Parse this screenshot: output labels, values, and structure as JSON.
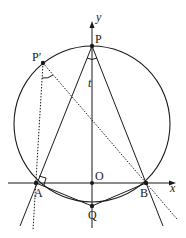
{
  "diagram": {
    "type": "geometry",
    "colors": {
      "stroke": "#1a1a1a",
      "background": "#ffffff"
    },
    "axes": {
      "x_label": "x",
      "y_label": "y",
      "origin_label": "O"
    },
    "circle": {
      "cx": 92,
      "cy": 124,
      "r": 78
    },
    "points": {
      "P": {
        "label": "P",
        "x": 92,
        "y": 46
      },
      "P_prime": {
        "label": "P′",
        "x": 43,
        "y": 63
      },
      "A": {
        "label": "A",
        "x": 36,
        "y": 183
      },
      "B": {
        "label": "B",
        "x": 146,
        "y": 183
      },
      "O": {
        "label": "O",
        "x": 92,
        "y": 183
      },
      "Q": {
        "label": "Q",
        "x": 92,
        "y": 206
      }
    },
    "segment_label": {
      "label": "t",
      "x": 89,
      "y": 86
    },
    "annotations": [
      "angle arc at P between PA and PB",
      "angle arc at P′ between P′A and P′B",
      "right angle mark at A between x-axis direction and line PA"
    ]
  }
}
